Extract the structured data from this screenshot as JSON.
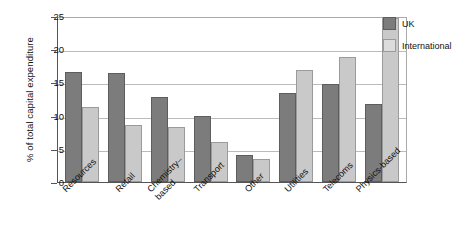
{
  "chart_data": {
    "type": "bar",
    "title": "",
    "xlabel": "",
    "ylabel": "% of total capital expenditure",
    "ylim": [
      0,
      25
    ],
    "yticks": [
      0,
      5,
      10,
      15,
      20,
      25
    ],
    "grid": true,
    "legend_position": "top-right-outside",
    "categories": [
      "Resources",
      "Chemistry–\nbased",
      "Retail",
      "Transport",
      "Other",
      "Utilities",
      "Telecoms",
      "Physics-based"
    ],
    "categories_ordered": [
      "Resources",
      "Retail",
      "Chemistry–\nbased",
      "Transport",
      "Other",
      "Utilities",
      "Telecoms",
      "Physics-based"
    ],
    "series": [
      {
        "name": "UK",
        "color": "#7c7c7c",
        "values": [
          16.6,
          16.4,
          12.8,
          9.9,
          4.0,
          13.4,
          14.8,
          11.7
        ]
      },
      {
        "name": "International",
        "color": "#c9c9c9",
        "values": [
          11.3,
          8.6,
          8.3,
          6.0,
          3.4,
          16.9,
          18.9,
          24.7
        ]
      }
    ]
  },
  "legend": {
    "items": [
      {
        "label": "UK"
      },
      {
        "label": "International"
      }
    ]
  }
}
